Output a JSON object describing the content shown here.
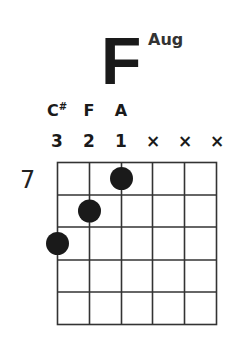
{
  "chord": {
    "root": "F",
    "quality": "Aug",
    "start_fret": "7"
  },
  "strings": [
    {
      "note": "C#",
      "note_base": "C",
      "note_accidental": "#",
      "marker": "3",
      "fret_offset": 3
    },
    {
      "note": "F",
      "note_base": "F",
      "note_accidental": "",
      "marker": "2",
      "fret_offset": 2
    },
    {
      "note": "A",
      "note_base": "A",
      "note_accidental": "",
      "marker": "1",
      "fret_offset": 1
    },
    {
      "note": "",
      "note_base": "",
      "note_accidental": "",
      "marker": "×",
      "fret_offset": null
    },
    {
      "note": "",
      "note_base": "",
      "note_accidental": "",
      "marker": "×",
      "fret_offset": null
    },
    {
      "note": "",
      "note_base": "",
      "note_accidental": "",
      "marker": "×",
      "fret_offset": null
    }
  ],
  "grid": {
    "columns": 6,
    "rows": 5,
    "line_color": "#333333",
    "dot_color": "#1a1a1a"
  }
}
